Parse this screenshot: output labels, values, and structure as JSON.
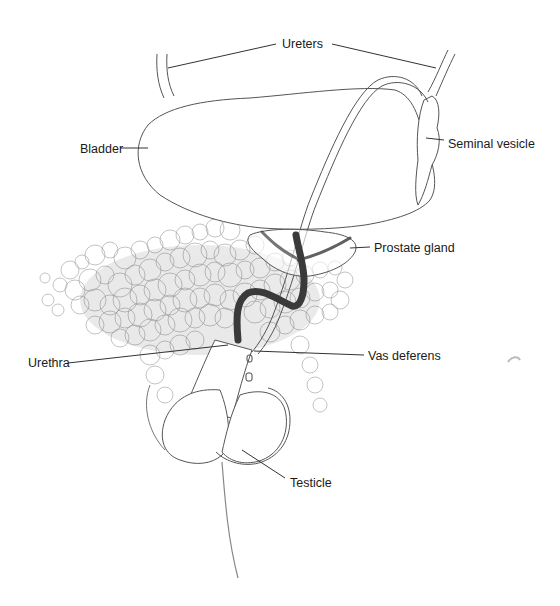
{
  "diagram": {
    "type": "anatomical-illustration",
    "labels": [
      {
        "id": "ureters",
        "text": "Ureters",
        "x": 282,
        "y": 13
      },
      {
        "id": "bladder",
        "text": "Bladder",
        "x": 80,
        "y": 143
      },
      {
        "id": "seminal_vesicle",
        "text": "Seminal vesicle",
        "x": 448,
        "y": 138
      },
      {
        "id": "prostate_gland",
        "text": "Prostate gland",
        "x": 374,
        "y": 242
      },
      {
        "id": "urethra",
        "text": "Urethra",
        "x": 28,
        "y": 347
      },
      {
        "id": "vas_deferens",
        "text": "Vas deferens",
        "x": 368,
        "y": 350
      },
      {
        "id": "testicle",
        "text": "Testicle",
        "x": 290,
        "y": 477
      }
    ],
    "colors": {
      "background": "#ffffff",
      "outline": "#555555",
      "leader": "#333333",
      "hair": "#6a6a6a",
      "urethra": "#3a3a3a",
      "text": "#1a1a1a"
    }
  }
}
